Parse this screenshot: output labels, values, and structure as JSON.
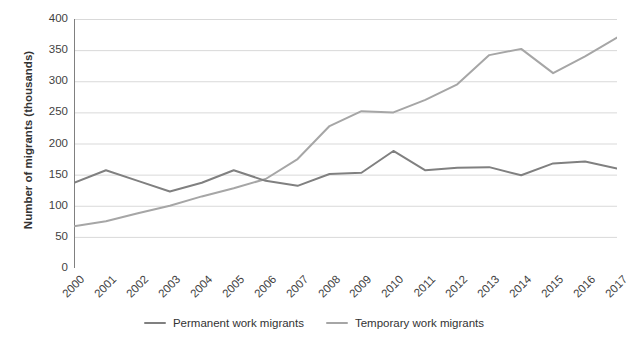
{
  "chart_data": {
    "type": "line",
    "title": "",
    "xlabel": "",
    "ylabel": "Number of migrants (thousands)",
    "categories": [
      "2000",
      "2001",
      "2002",
      "2003",
      "2004",
      "2005",
      "2006",
      "2007",
      "2008",
      "2009",
      "2010",
      "2011",
      "2012",
      "2013",
      "2014",
      "2015",
      "2016",
      "2017"
    ],
    "ylim": [
      0,
      400
    ],
    "yticks": [
      0,
      50,
      100,
      150,
      200,
      250,
      300,
      350,
      400
    ],
    "ytick_labels": [
      "0",
      "50",
      "100",
      "150",
      "200",
      "250",
      "300",
      "350",
      "400"
    ],
    "grid": "horizontal",
    "legend_position": "bottom",
    "series": [
      {
        "name": "Permanent work migrants",
        "color": "#808080",
        "values": [
          137,
          157,
          140,
          123,
          137,
          157,
          140,
          132,
          151,
          153,
          188,
          157,
          161,
          162,
          149,
          168,
          171,
          160
        ]
      },
      {
        "name": "Temporary work migrants",
        "color": "#a6a6a6",
        "values": [
          67,
          75,
          88,
          100,
          115,
          128,
          143,
          175,
          228,
          252,
          250,
          270,
          295,
          342,
          352,
          313,
          340,
          370
        ]
      }
    ]
  },
  "axes": {
    "y_title": "Number of migrants (thousands)"
  },
  "colors": {
    "permanent": "#808080",
    "temporary": "#a6a6a6",
    "grid": "#d9d9d9",
    "axis": "#808080",
    "text": "#3f3f3f",
    "background": "#ffffff"
  }
}
